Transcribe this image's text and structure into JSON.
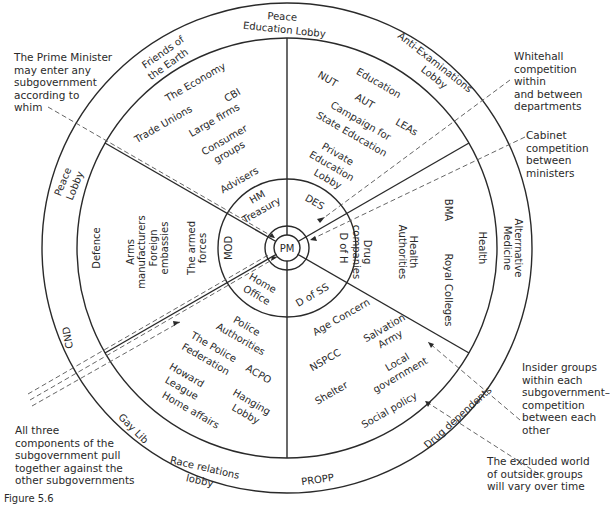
{
  "figure": {
    "caption": "Figure 5.6",
    "center": {
      "label": "PM"
    },
    "departments": [
      {
        "id": "treasury",
        "label": "HM Treasury"
      },
      {
        "id": "des",
        "label": "DES"
      },
      {
        "id": "doh",
        "label": "D of H"
      },
      {
        "id": "doss",
        "label": "D of SS"
      },
      {
        "id": "home-office",
        "label": "Home Office"
      },
      {
        "id": "mod",
        "label": "MOD"
      }
    ],
    "subgovernments": [
      {
        "id": "economy",
        "policy_area": "The Economy",
        "insiders": [
          "CBI",
          "Trade Unions",
          "Large firms",
          "Consumer groups",
          "Advisers"
        ]
      },
      {
        "id": "education",
        "policy_area": "Education",
        "insiders": [
          "NUT",
          "AUT",
          "Campaign for State Education",
          "LEAs",
          "Private Education Lobby"
        ]
      },
      {
        "id": "health",
        "policy_area": "Health",
        "insiders": [
          "BMA",
          "Royal Colleges",
          "Health Authorities",
          "Drug companies"
        ]
      },
      {
        "id": "social",
        "policy_area": "Social policy",
        "insiders": [
          "Age Concern",
          "Salvation Army",
          "NSPCC",
          "Local government",
          "Shelter"
        ]
      },
      {
        "id": "home",
        "policy_area": "Home affairs",
        "insiders": [
          "Police Authorities",
          "The Police Federation",
          "ACPO",
          "Howard League",
          "Hanging Lobby"
        ]
      },
      {
        "id": "defence",
        "policy_area": "Defence",
        "insiders": [
          "Arms manufacturers",
          "Foreign embassies",
          "The armed forces"
        ]
      }
    ],
    "outsiders": [
      "Peace Education Lobby",
      "Anti-Examinations Lobby",
      "Alterrnative Medicine",
      "Drug dependents",
      "PROPP",
      "Race relations lobby",
      "Gay Lib",
      "CND",
      "Peace Lobby",
      "Friends of the Earth"
    ],
    "annotations": {
      "pm": "The Prime Minister\nmay enter any\nsubgovernment\naccording to\nwhim",
      "whitehall": "Whitehall\ncompetition within\nand between\ndepartments",
      "cabinet": "Cabinet\ncompetition\nbetween\nministers",
      "insider": "Insider groups\nwithin each\nsubgovernment–\ncompetition\nbetween each\nother",
      "excluded": "The excluded world\nof outsider groups\nwill vary over time",
      "three": "All three\ncomponents of the\nsubgovernment pull\ntogether against the\nother subgovernments"
    }
  }
}
